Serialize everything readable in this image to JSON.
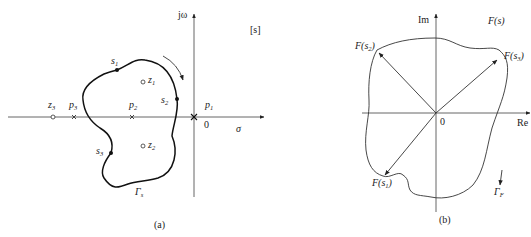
{
  "header_fragment": "",
  "panel_a": {
    "caption": "(a)",
    "plane_tag": "[s]",
    "imag_axis_label": "jω",
    "real_axis_label": "σ",
    "origin_label": "0",
    "contour_label": "Γ",
    "contour_sub": "s",
    "points": [
      {
        "name": "s",
        "sub": "1",
        "kind": "contour-point"
      },
      {
        "name": "s",
        "sub": "2",
        "kind": "contour-point"
      },
      {
        "name": "s",
        "sub": "3",
        "kind": "contour-point"
      }
    ],
    "zeros": [
      {
        "name": "z",
        "sub": "1"
      },
      {
        "name": "z",
        "sub": "2"
      },
      {
        "name": "z",
        "sub": "3"
      }
    ],
    "poles": [
      {
        "name": "p",
        "sub": "1"
      },
      {
        "name": "p",
        "sub": "2"
      },
      {
        "name": "p",
        "sub": "3"
      }
    ],
    "traversal_direction": "clockwise"
  },
  "panel_b": {
    "caption": "(b)",
    "plane_tag": "F(s)",
    "imag_axis_label": "Im",
    "real_axis_label": "Re",
    "origin_label": "0",
    "contour_label": "Γ",
    "contour_sub": "F",
    "vectors": [
      {
        "label_pre": "F(",
        "var": "s",
        "sub": "1",
        "label_post": ")"
      },
      {
        "label_pre": "F(",
        "var": "s",
        "sub": "2",
        "label_post": ")"
      },
      {
        "label_pre": "F(",
        "var": "s",
        "sub": "3",
        "label_post": ")"
      }
    ]
  }
}
